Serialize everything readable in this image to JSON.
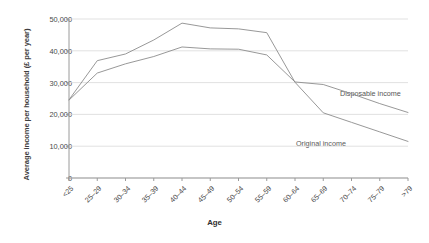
{
  "chart_data": {
    "type": "line",
    "title": "",
    "xlabel": "Age",
    "ylabel": "Average income per household (£ per year)",
    "categories": [
      "<25",
      "25–29",
      "30–34",
      "35–39",
      "40–44",
      "45–49",
      "50–54",
      "55–59",
      "60–64",
      "65–69",
      "70–74",
      "75–79",
      ">79"
    ],
    "yticks": [
      "0",
      "10,000",
      "20,000",
      "30,000",
      "40,000",
      "50,000"
    ],
    "ylim": [
      0,
      50000
    ],
    "ytick_values": [
      0,
      10000,
      20000,
      30000,
      40000,
      50000
    ],
    "grid": true,
    "legend_position": "inline-annotation",
    "series": [
      {
        "name": "Disposable income",
        "color": "#8c8c8c",
        "values": [
          24500,
          33000,
          35900,
          38200,
          41200,
          40600,
          40500,
          38700,
          30200,
          29400,
          26500,
          23400,
          20600
        ]
      },
      {
        "name": "Original income",
        "color": "#8c8c8c",
        "values": [
          24600,
          36900,
          39000,
          43400,
          48700,
          47200,
          46900,
          45700,
          30100,
          20500,
          17500,
          14500,
          11500
        ]
      }
    ],
    "annotations": [
      {
        "text": "Disposable income",
        "x_px": 340,
        "y_px": 89
      },
      {
        "text": "Original income",
        "x_px": 296,
        "y_px": 139
      }
    ]
  },
  "colors": {
    "grid": "#d9d9d9",
    "axis": "#9a9a9a",
    "line": "#8c8c8c",
    "text": "#4a4a4a",
    "background": "#ffffff"
  }
}
